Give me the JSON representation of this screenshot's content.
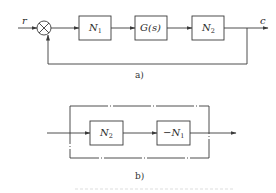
{
  "diagram_a": {
    "input_label": "r",
    "output_label": "c",
    "blocks": [
      {
        "main": "N",
        "sub": "1"
      },
      {
        "main": "G(s)",
        "sub": ""
      },
      {
        "main": "N",
        "sub": "2"
      }
    ],
    "summing_junction": "multiply-cross-circle",
    "feedback": "unity",
    "caption": "a)"
  },
  "diagram_b": {
    "blocks": [
      {
        "main": "N",
        "sub": "2"
      },
      {
        "main": "−N",
        "sub": "1"
      }
    ],
    "outer_frame": "dash-dot rectangle",
    "caption": "b)"
  },
  "figure_caption": "",
  "colors": {
    "line": "#3a3a3a",
    "text": "#2a2a2a",
    "background": "#ffffff"
  }
}
